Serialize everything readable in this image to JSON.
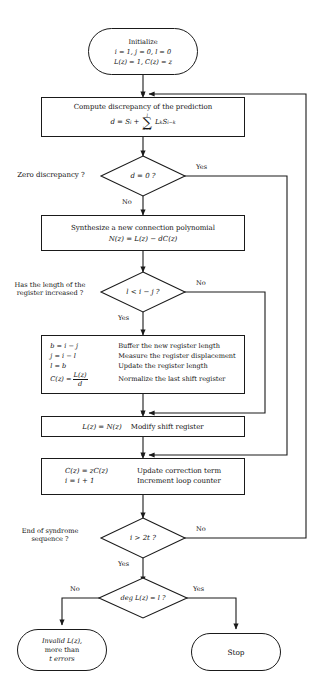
{
  "nodes": {
    "initialize": {
      "kind": "terminal",
      "line1": "Initialize",
      "line2": "i = 1,   j = 0,   l = 0",
      "line3": "L(z) = 1,     C(z) = z"
    },
    "compute_discrepancy": {
      "kind": "process",
      "line1": "Compute discrepancy of the prediction",
      "formula": "d = S",
      "formula_sub": "i",
      "formula_plus": "+",
      "sum_upper": "l",
      "sum_lower": "k=1",
      "sum_body": "L",
      "sum_body_sub": "k",
      "sum_body2": "S",
      "sum_body2_sub": "i−k"
    },
    "zero_discrepancy": {
      "kind": "decision",
      "side_label_line1": "Zero discrepancy ?",
      "condition": "d = 0 ?",
      "yes": "Yes",
      "no": "No"
    },
    "synthesise": {
      "kind": "process",
      "line1": "Synthesize a new connection polynomial",
      "line2": "N(z) = L(z) − dC(z)"
    },
    "length_increased": {
      "kind": "decision",
      "side_label_line1": "Has the length of the",
      "side_label_line2": "register increased ?",
      "condition": "l < i − j ?",
      "yes": "Yes",
      "no": "No"
    },
    "update_block": {
      "kind": "process",
      "rows": [
        {
          "lhs": "b = i − j",
          "rhs": "Buffer the new register length"
        },
        {
          "lhs": "j = i − l",
          "rhs": "Measure the register displacement"
        },
        {
          "lhs": "l = b",
          "rhs": "Update the register length"
        },
        {
          "lhs_pre": "C(z) =",
          "lhs_num": "L(z)",
          "lhs_den": "d",
          "rhs": "Normalize the last shift register"
        }
      ]
    },
    "modify_shift_register": {
      "kind": "process",
      "lhs": "L(z) = N(z)",
      "rhs": "Modify shift register"
    },
    "update_correction": {
      "kind": "process",
      "rows": [
        {
          "lhs": "C(z) = zC(z)",
          "rhs": "Update correction term"
        },
        {
          "lhs": "i = i + 1",
          "rhs": "Increment loop counter"
        }
      ]
    },
    "end_of_syndrome": {
      "kind": "decision",
      "side_label_line1": "End of syndrome",
      "side_label_line2": "sequence ?",
      "condition": "i > 2t ?",
      "yes": "Yes",
      "no": "No"
    },
    "deg_check": {
      "kind": "decision",
      "condition": "deg L(z) = l ?",
      "yes": "Yes",
      "no": "No"
    },
    "invalid": {
      "kind": "terminal",
      "line1": "Invalid L(z),",
      "line2": "more than",
      "line3": "t errors"
    },
    "stop": {
      "kind": "terminal",
      "line1": "Stop"
    }
  },
  "colors": {
    "stroke": "#1a1a1a",
    "text": "#111111",
    "background": "#ffffff"
  }
}
